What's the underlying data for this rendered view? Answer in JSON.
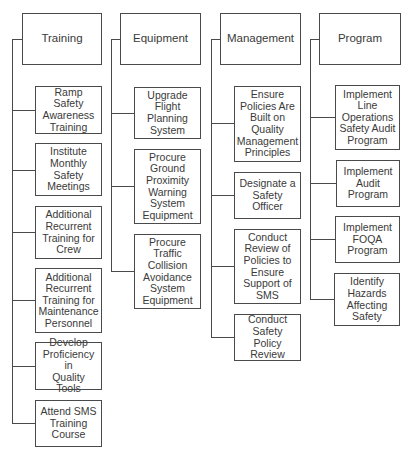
{
  "diagram": {
    "cropped_title_fragment": "",
    "colors": {
      "line": "#4a4a4a",
      "text": "#3a3a3a",
      "background": "#ffffff"
    },
    "columns": [
      {
        "label": "Training",
        "spine_x": 12,
        "header_box": {
          "x": 22,
          "y": 13,
          "w": 80,
          "h": 52
        },
        "spine_top": 39,
        "spine_bottom": 423,
        "items": [
          {
            "label": "Ramp Safety\nAwareness\nTraining",
            "x": 35,
            "y": 86,
            "w": 67,
            "h": 48,
            "cy": 110
          },
          {
            "label": "Institute\nMonthly\nSafety\nMeetings",
            "x": 35,
            "y": 143,
            "w": 67,
            "h": 53,
            "cy": 170
          },
          {
            "label": "Additional\nRecurrent\nTraining for\nCrew",
            "x": 35,
            "y": 206,
            "w": 67,
            "h": 53,
            "cy": 232
          },
          {
            "label": "Additional\nRecurrent\nTraining for\nMaintenance\nPersonnel",
            "x": 35,
            "y": 268,
            "w": 67,
            "h": 65,
            "cy": 300
          },
          {
            "label": "Develop\nProficiency in\nQuality Tools",
            "x": 35,
            "y": 342,
            "w": 67,
            "h": 48,
            "cy": 366
          },
          {
            "label": "Attend SMS\nTraining\nCourse",
            "x": 35,
            "y": 400,
            "w": 67,
            "h": 47,
            "cy": 423
          }
        ]
      },
      {
        "label": "Equipment",
        "spine_x": 111,
        "header_box": {
          "x": 120,
          "y": 13,
          "w": 81,
          "h": 52
        },
        "spine_top": 39,
        "spine_bottom": 271,
        "items": [
          {
            "label": "Upgrade\nFlight\nPlanning\nSystem",
            "x": 134,
            "y": 87,
            "w": 67,
            "h": 52,
            "cy": 113
          },
          {
            "label": "Procure\nGround\nProximity\nWarning\nSystem\nEquipment",
            "x": 134,
            "y": 149,
            "w": 67,
            "h": 75,
            "cy": 186
          },
          {
            "label": "Procure\nTraffic\nCollision\nAvoidance\nSystem\nEquipment",
            "x": 134,
            "y": 234,
            "w": 67,
            "h": 75,
            "cy": 271
          }
        ]
      },
      {
        "label": "Management",
        "spine_x": 211,
        "header_box": {
          "x": 220,
          "y": 13,
          "w": 81,
          "h": 52
        },
        "spine_top": 39,
        "spine_bottom": 337,
        "items": [
          {
            "label": "Ensure\nPolicies Are\nBuilt on\nQuality\nManagement\nPrinciples",
            "x": 234,
            "y": 86,
            "w": 67,
            "h": 76,
            "cy": 123
          },
          {
            "label": "Designate a\nSafety Officer",
            "x": 234,
            "y": 172,
            "w": 67,
            "h": 47,
            "cy": 195
          },
          {
            "label": "Conduct\nReview of\nPolicies to\nEnsure\nSupport of\nSMS",
            "x": 234,
            "y": 229,
            "w": 67,
            "h": 75,
            "cy": 266
          },
          {
            "label": "Conduct\nSafety Policy\nReview",
            "x": 234,
            "y": 314,
            "w": 67,
            "h": 47,
            "cy": 337
          }
        ]
      },
      {
        "label": "Program",
        "spine_x": 310,
        "header_box": {
          "x": 319,
          "y": 13,
          "w": 82,
          "h": 52
        },
        "spine_top": 39,
        "spine_bottom": 299,
        "items": [
          {
            "label": "Implement\nLine\nOperations\nSafety Audit\nProgram",
            "x": 335,
            "y": 85,
            "w": 65,
            "h": 65,
            "cy": 117
          },
          {
            "label": "Implement\nAudit\nProgram",
            "x": 336,
            "y": 160,
            "w": 64,
            "h": 47,
            "cy": 183
          },
          {
            "label": "Implement\nFOQA\nProgram",
            "x": 335,
            "y": 216,
            "w": 65,
            "h": 47,
            "cy": 239
          },
          {
            "label": "Identify\nHazards\nAffecting\nSafety",
            "x": 334,
            "y": 273,
            "w": 66,
            "h": 53,
            "cy": 299
          }
        ]
      }
    ]
  }
}
